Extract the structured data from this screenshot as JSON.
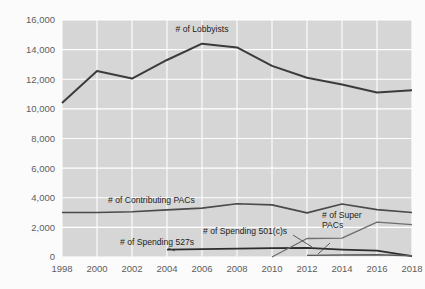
{
  "chart_data": {
    "type": "line",
    "title": "",
    "subtitle": "",
    "xlabel": "",
    "ylabel": "",
    "x": [
      1998,
      2000,
      2002,
      2004,
      2006,
      2008,
      2010,
      2012,
      2014,
      2016,
      2018
    ],
    "categories": [
      "1998",
      "2000",
      "2002",
      "2004",
      "2006",
      "2008",
      "2010",
      "2012",
      "2014",
      "2016",
      "2018"
    ],
    "xlim": [
      1998,
      2018
    ],
    "ylim": [
      0,
      16000
    ],
    "yticks": [
      0,
      2000,
      4000,
      6000,
      8000,
      10000,
      12000,
      14000,
      16000
    ],
    "ytick_labels": [
      "0",
      "2,000",
      "4,000",
      "6,000",
      "8,000",
      "10,000",
      "12,000",
      "14,000",
      "16,000"
    ],
    "xticks": [
      1998,
      2000,
      2002,
      2004,
      2006,
      2008,
      2010,
      2012,
      2014,
      2016,
      2018
    ],
    "xtick_labels": [
      "1998",
      "2000",
      "2002",
      "2004",
      "2006",
      "2008",
      "2010",
      "2012",
      "2014",
      "2016",
      "2018"
    ],
    "grid": true,
    "grid_color": "#ffffff",
    "plot_background": "#d6d6d6",
    "legend_position": "inline-labels",
    "series": [
      {
        "name": "# of Lobbyists",
        "label": "# of Lobbyists",
        "color": "#3b3b3b",
        "width": 2.0,
        "x": [
          1998,
          2000,
          2002,
          2004,
          2006,
          2008,
          2010,
          2012,
          2014,
          2016,
          2018
        ],
        "values": [
          10400,
          12550,
          12050,
          13300,
          14400,
          14150,
          12900,
          12100,
          11650,
          11100,
          11250
        ]
      },
      {
        "name": "# of Contributing PACs",
        "label": "# of Contributing PACs",
        "color": "#4a4a4a",
        "width": 1.6,
        "x": [
          1998,
          2000,
          2002,
          2004,
          2006,
          2008,
          2010,
          2012,
          2014,
          2016,
          2018
        ],
        "values": [
          3000,
          3000,
          3050,
          3180,
          3300,
          3600,
          3520,
          2980,
          3580,
          3200,
          3000
        ]
      },
      {
        "name": "# of Spending 527s",
        "label": "# of Spending 527s",
        "color": "#2d2d2d",
        "width": 1.8,
        "x": [
          2004,
          2006,
          2008,
          2010,
          2012,
          2014,
          2016,
          2018
        ],
        "values": [
          500,
          530,
          560,
          600,
          620,
          500,
          430,
          60
        ]
      },
      {
        "name": "# of Spending 501(c)s",
        "label": "# of Spending 501(c)s",
        "color": "#6e6e6e",
        "width": 1.3,
        "x": [
          2010,
          2012,
          2014,
          2016,
          2018
        ],
        "values": [
          0,
          1250,
          1280,
          2350,
          2180
        ]
      },
      {
        "name": "# of Super PACs",
        "label": "# of Super PACs",
        "color": "#5a5a5a",
        "width": 1.4,
        "x": [
          2012,
          2014,
          2016,
          2018
        ],
        "values": [
          110,
          130,
          150,
          80
        ]
      }
    ],
    "annotations": [
      {
        "text": "# of Lobbyists",
        "x": 2006,
        "y": 15200
      },
      {
        "text": "# of Contributing PACs",
        "x": 2001.4,
        "y": 4050
      },
      {
        "text": "# of Spending 527s",
        "x": 2003.3,
        "y": 900
      },
      {
        "text": "# of Spending 501(c)s",
        "x": 2007.1,
        "y": 1700
      },
      {
        "text": "# of Super PACs",
        "x": 2013.7,
        "y": 2550
      }
    ]
  },
  "labels": {
    "lobbyists": "# of Lobbyists",
    "contributing_pacs": "# of Contributing PACs",
    "spending_527s": "# of Spending 527s",
    "spending_501cs": "# of Spending 501(c)s",
    "super_pacs_line1": "# of Super",
    "super_pacs_line2": "PACs"
  },
  "yaxis": {
    "t0": "0",
    "t1": "2,000",
    "t2": "4,000",
    "t3": "6,000",
    "t4": "8,000",
    "t5": "10,000",
    "t6": "12,000",
    "t7": "14,000",
    "t8": "16,000"
  },
  "xaxis": {
    "t0": "1998",
    "t1": "2000",
    "t2": "2002",
    "t3": "2004",
    "t4": "2006",
    "t5": "2008",
    "t6": "2010",
    "t7": "2012",
    "t8": "2014",
    "t9": "2016",
    "t10": "2018"
  }
}
